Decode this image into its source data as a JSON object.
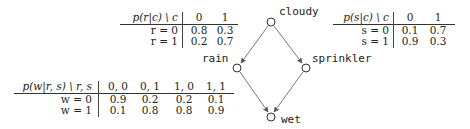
{
  "graph": {
    "nodes": [
      {
        "id": "cloudy",
        "label": "cloudy",
        "x": 271,
        "y": 22
      },
      {
        "id": "rain",
        "label": "rain",
        "x": 237,
        "y": 68
      },
      {
        "id": "sprinkler",
        "label": "sprinkler",
        "x": 306,
        "y": 68
      },
      {
        "id": "wet",
        "label": "wet",
        "x": 271,
        "y": 117
      }
    ],
    "edges": [
      {
        "from": "cloudy",
        "to": "rain"
      },
      {
        "from": "cloudy",
        "to": "sprinkler"
      },
      {
        "from": "rain",
        "to": "wet"
      },
      {
        "from": "sprinkler",
        "to": "wet"
      }
    ]
  },
  "tables": {
    "rain_given_cloudy": {
      "header_label": "p(r|c) \\ c",
      "columns": [
        "0",
        "1"
      ],
      "rows": [
        {
          "label": "r = 0",
          "values": [
            "0.8",
            "0.3"
          ]
        },
        {
          "label": "r = 1",
          "values": [
            "0.2",
            "0.7"
          ]
        }
      ]
    },
    "sprinkler_given_cloudy": {
      "header_label": "p(s|c) \\ c",
      "columns": [
        "0",
        "1"
      ],
      "rows": [
        {
          "label": "s = 0",
          "values": [
            "0.1",
            "0.7"
          ]
        },
        {
          "label": "s = 1",
          "values": [
            "0.9",
            "0.3"
          ]
        }
      ]
    },
    "wet_given_rain_sprinkler": {
      "header_label": "p(w|r, s) \\ r, s",
      "columns": [
        "0, 0",
        "0, 1",
        "1, 0",
        "1, 1"
      ],
      "rows": [
        {
          "label": "w = 0",
          "values": [
            "0.9",
            "0.2",
            "0.2",
            "0.1"
          ]
        },
        {
          "label": "w = 1",
          "values": [
            "0.1",
            "0.8",
            "0.8",
            "0.9"
          ]
        }
      ]
    }
  },
  "colors": {
    "ink": "#222222",
    "edge": "#555555",
    "background": "#ffffff"
  }
}
